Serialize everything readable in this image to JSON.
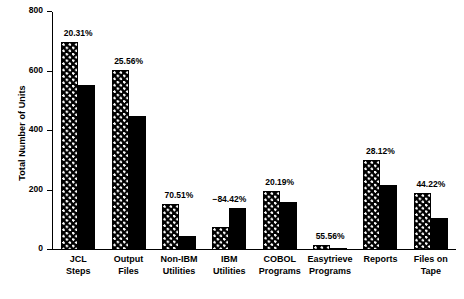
{
  "chart_data": {
    "type": "bar",
    "title": "",
    "xlabel": "",
    "ylabel": "Total Number of Units",
    "ylim": [
      0,
      800
    ],
    "yticks": [
      0,
      200,
      400,
      600,
      800
    ],
    "ytick_labels": [
      "0",
      "200",
      "400",
      "600",
      "800"
    ],
    "grid": false,
    "legend": null,
    "categories": [
      "JCL\nSteps",
      "Output\nFiles",
      "Non-IBM\nUtilities",
      "IBM\nUtilities",
      "COBOL\nPrograms",
      "Easytrieve\nPrograms",
      "Reports",
      "Files on\nTape"
    ],
    "series": [
      {
        "name": "series-1",
        "style": "checkered",
        "values": [
          700,
          605,
          156,
          77,
          200,
          18,
          303,
          193
        ]
      },
      {
        "name": "series-2",
        "style": "solid-black",
        "values": [
          555,
          450,
          46,
          142,
          160,
          8,
          218,
          108
        ]
      }
    ],
    "annotations": [
      "20.31%",
      "25.56%",
      "70.51%",
      "−84.42%",
      "20.19%",
      "55.56%",
      "28.12%",
      "44.22%"
    ]
  }
}
